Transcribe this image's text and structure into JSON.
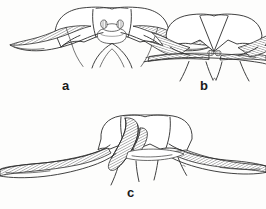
{
  "plate": {
    "title": "Anatomical line-drawing plate",
    "background_color": "#fdfdfc",
    "ink_color": "#2b2b2b",
    "figure_count": 3,
    "figures": [
      {
        "id": "a",
        "label": "a",
        "label_position": "below-center",
        "description": "Dorsal view of sclerotised plate with paired median knob-like processes at apex, flanked by broad cross-hatched lateral lobes and a V-shaped median emargination below",
        "features": [
          "paired median knobs",
          "cross-hatched lateral arms",
          "median V-shaped keel",
          "rounded apical margin"
        ]
      },
      {
        "id": "b",
        "label": "b",
        "label_position": "below-center",
        "description": "Similar plate with deep V-shaped median notch at apex, narrow transverse cross-hatched band across the base and four slender descending processes",
        "features": [
          "deep V notch",
          "transverse hatched band",
          "small median tubercle",
          "four slender processes"
        ]
      },
      {
        "id": "c",
        "label": "c",
        "label_position": "below-center",
        "description": "Oblique view showing an elongate curved finger-like hatched process crossing the plate, broad hatched lateral wings and four slender descending processes",
        "features": [
          "curved digitate process",
          "broad hatched wings",
          "four slender processes",
          "asymmetric outline"
        ]
      }
    ],
    "labels": {
      "a": "a",
      "b": "b",
      "c": "c"
    }
  }
}
